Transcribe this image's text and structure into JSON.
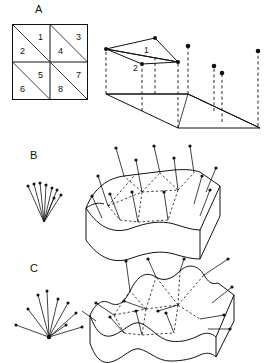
{
  "figure": {
    "type": "scientific-diagram",
    "background": "#ffffff",
    "ink_color": "#111111",
    "width": 266,
    "height": 363
  },
  "panels": [
    {
      "id": "A",
      "label": "A",
      "label_x": 35,
      "label_y": 4,
      "description": "Triangulated 2x2 grid and its 3D height-field realization",
      "grid": {
        "name": "triangulated-grid",
        "x": 12,
        "y": 24,
        "cell": 36,
        "rows": 2,
        "cols": 2,
        "diagonal_direction": "top-left-to-bottom-right",
        "triangle_count": 8,
        "triangles": [
          {
            "id": 1,
            "label": "1",
            "cell_row": 0,
            "cell_col": 0,
            "half": "upper-right",
            "lx": 29,
            "ly": 15
          },
          {
            "id": 2,
            "label": "2",
            "cell_row": 0,
            "cell_col": 0,
            "half": "lower-left",
            "lx": 10,
            "ly": 27
          },
          {
            "id": 3,
            "label": "3",
            "cell_row": 0,
            "cell_col": 1,
            "half": "upper-right",
            "lx": 29,
            "ly": 15
          },
          {
            "id": 4,
            "label": "4",
            "cell_row": 0,
            "cell_col": 1,
            "half": "lower-left",
            "lx": 10,
            "ly": 27
          },
          {
            "id": 5,
            "label": "5",
            "cell_row": 1,
            "cell_col": 0,
            "half": "upper-right",
            "lx": 29,
            "ly": 15
          },
          {
            "id": 6,
            "label": "6",
            "cell_row": 1,
            "cell_col": 0,
            "half": "lower-left",
            "lx": 10,
            "ly": 27
          },
          {
            "id": 7,
            "label": "7",
            "cell_row": 1,
            "cell_col": 1,
            "half": "upper-right",
            "lx": 29,
            "ly": 15
          },
          {
            "id": 8,
            "label": "8",
            "cell_row": 1,
            "cell_col": 1,
            "half": "lower-left",
            "lx": 10,
            "ly": 27
          }
        ]
      },
      "height_field": {
        "name": "height-field-3d",
        "x": 100,
        "y": 18,
        "base_polygon": "parallelogram",
        "face_labels": [
          {
            "id": 1,
            "label": "1",
            "lx": 46,
            "ly": 32
          },
          {
            "id": 2,
            "label": "2",
            "lx": 35,
            "ly": 52
          }
        ],
        "elevated_point_count": 8,
        "dashed_verticals": true
      }
    },
    {
      "id": "B",
      "label": "B",
      "label_x": 30,
      "label_y": 150,
      "description": "Gently undulating surface block with vertex normal vectors",
      "gauss_fan": {
        "name": "normal-vector-fan-b",
        "x": 25,
        "y": 178,
        "spread_degrees": 55,
        "vector_count": 8,
        "origin_x": 22,
        "origin_y": 40
      },
      "block": {
        "name": "surface-block-b",
        "x": 82,
        "y": 150,
        "surface_roughness": "low",
        "normal_count": 13,
        "mesh_edges": "dashed"
      }
    },
    {
      "id": "C",
      "label": "C",
      "label_x": 30,
      "label_y": 263,
      "description": "Strongly undulating surface block with widely splayed vertex normals",
      "gauss_fan": {
        "name": "normal-vector-fan-c",
        "x": 18,
        "y": 288,
        "spread_degrees": 150,
        "vector_count": 9,
        "origin_x": 35,
        "origin_y": 48
      },
      "block": {
        "name": "surface-block-c",
        "x": 92,
        "y": 262,
        "surface_roughness": "high",
        "normal_count": 14,
        "mesh_edges": "dashed"
      }
    }
  ]
}
